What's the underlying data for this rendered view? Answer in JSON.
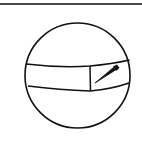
{
  "figure": {
    "icons": [
      "sphere-icon",
      "band-icon",
      "pencil-icon"
    ],
    "colors": {
      "stroke": "#111111",
      "rule": "#4a4a4a",
      "background": "#ffffff"
    }
  }
}
